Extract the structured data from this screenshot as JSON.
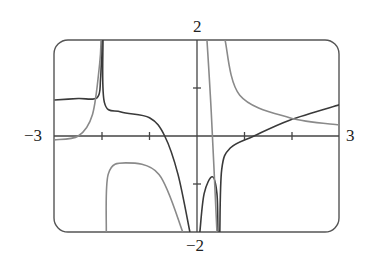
{
  "chart_data": {
    "type": "line",
    "title": "",
    "xlabel": "",
    "ylabel": "",
    "xlim": [
      -3,
      3
    ],
    "ylim": [
      -2,
      2
    ],
    "grid": false,
    "legend": "none",
    "tick_labels": {
      "x_min": "−3",
      "x_max": "3",
      "y_max": "2",
      "y_min": "−2"
    },
    "x_ticks": [
      -2,
      -1,
      0,
      1,
      2
    ],
    "y_ticks": [
      -1,
      1
    ],
    "series": [
      {
        "name": "dark curve",
        "color": "#3a3a3a",
        "segments": [
          [
            [
              -3.0,
              0.75
            ],
            [
              -2.5,
              0.78
            ],
            [
              -2.1,
              0.8
            ],
            [
              -2.03,
              1.2
            ],
            [
              -2.0,
              2.0
            ]
          ],
          [
            [
              -1.98,
              2.0
            ],
            [
              -1.95,
              0.7
            ],
            [
              -1.6,
              0.5
            ],
            [
              -1.0,
              0.38
            ],
            [
              -0.68,
              0.0
            ],
            [
              -0.4,
              -0.8
            ],
            [
              -0.15,
              -2.0
            ]
          ],
          [
            [
              0.06,
              -2.0
            ],
            [
              0.15,
              -1.2
            ],
            [
              0.32,
              -0.85
            ],
            [
              0.42,
              -1.2
            ],
            [
              0.44,
              -2.0
            ]
          ],
          [
            [
              0.48,
              -2.0
            ],
            [
              0.52,
              -0.7
            ],
            [
              0.7,
              -0.25
            ],
            [
              1.2,
              0.0
            ],
            [
              1.95,
              0.33
            ],
            [
              3.0,
              0.65
            ]
          ]
        ]
      },
      {
        "name": "light curve",
        "color": "#8a8a8a",
        "segments": [
          [
            [
              -3.0,
              -0.08
            ],
            [
              -2.5,
              0.0
            ],
            [
              -2.2,
              0.45
            ],
            [
              -2.05,
              1.5
            ],
            [
              -2.02,
              2.0
            ]
          ],
          [
            [
              -1.91,
              -2.0
            ],
            [
              -1.87,
              -0.8
            ],
            [
              -1.5,
              -0.56
            ],
            [
              -0.8,
              -0.8
            ],
            [
              -0.3,
              -2.0
            ]
          ],
          [
            [
              0.21,
              2.0
            ],
            [
              0.3,
              0.5
            ],
            [
              0.42,
              -2.0
            ]
          ],
          [
            [
              0.59,
              2.0
            ],
            [
              0.9,
              0.85
            ],
            [
              1.95,
              0.38
            ],
            [
              3.0,
              0.23
            ]
          ]
        ]
      }
    ]
  }
}
